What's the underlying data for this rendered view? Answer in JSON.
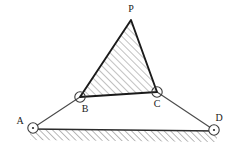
{
  "figure": {
    "background_color": "#ffffff",
    "line_color": "#3a3a3a",
    "heavy_line_color": "#1a1a1a",
    "hatch_color": "#808080",
    "joints": [
      {
        "id": "A",
        "label": "A",
        "cx": 33,
        "cy": 128,
        "r": 5.2,
        "label_x": 20,
        "label_y": 124,
        "type": "ground-pivot"
      },
      {
        "id": "B",
        "label": "B",
        "cx": 80,
        "cy": 97,
        "r": 5.2,
        "label_x": 85,
        "label_y": 112,
        "type": "pin-joint"
      },
      {
        "id": "C",
        "label": "C",
        "cx": 157,
        "cy": 92,
        "r": 5.2,
        "label_x": 157,
        "label_y": 107,
        "type": "pin-joint"
      },
      {
        "id": "D",
        "label": "D",
        "cx": 214,
        "cy": 130,
        "r": 5.2,
        "label_x": 219,
        "label_y": 121,
        "type": "ground-pivot"
      },
      {
        "id": "P",
        "label": "P",
        "cx": 131,
        "cy": 20,
        "r": 0,
        "label_x": 131,
        "label_y": 12,
        "type": "coupler-apex"
      }
    ],
    "links": [
      {
        "id": "AB",
        "from": "A",
        "to": "B",
        "x1": 33,
        "y1": 128,
        "x2": 80,
        "y2": 97,
        "weight": "thin"
      },
      {
        "id": "CD",
        "from": "C",
        "to": "D",
        "x1": 157,
        "y1": 92,
        "x2": 214,
        "y2": 130,
        "weight": "thin"
      }
    ],
    "coupler_triangle": {
      "id": "PBC",
      "points": "131,20 80,97 157,92",
      "hatched": true,
      "hatch_direction": "up-right",
      "weight": "heavy"
    },
    "ground": {
      "id": "ground-line",
      "x1": 30,
      "y1": 129,
      "x2": 217,
      "y2": 131,
      "hatched": true,
      "hatch_direction": "up-right",
      "hatch_depth": 8
    }
  }
}
